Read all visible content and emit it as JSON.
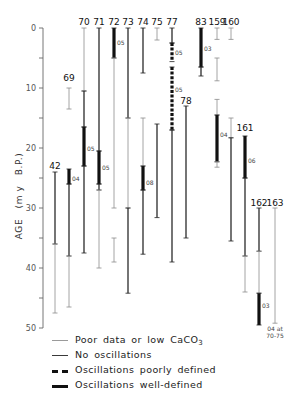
{
  "chart_data": {
    "type": "bar",
    "subtype": "floating-range-bars",
    "title": "",
    "xlabel": "",
    "ylabel": "AGE   (m y   B.P.)",
    "ylim": [
      0,
      50
    ],
    "y_inverted": true,
    "yticks": [
      0,
      10,
      20,
      30,
      40,
      50
    ],
    "yminor_ticks": [
      5,
      15,
      25,
      35,
      45
    ],
    "grid": false,
    "styles": {
      "poor": {
        "label": "Poor data or low CaCO3",
        "color": "#9a9a9a",
        "width": 0.9,
        "dash": ""
      },
      "none": {
        "label": "No oscillations",
        "color": "#3a3a3a",
        "width": 1.4,
        "dash": ""
      },
      "poorly": {
        "label": "Oscillations poorly defined",
        "color": "#111111",
        "width": 3.2,
        "dash": "3,1.6"
      },
      "well": {
        "label": "Oscillations well-defined",
        "color": "#111111",
        "width": 3.2,
        "dash": ""
      }
    },
    "sites": [
      {
        "site": "42",
        "x": 55,
        "label_y": 169,
        "segments": [
          {
            "from": 24,
            "to": 36,
            "style": "none"
          },
          {
            "from": 36,
            "to": 47.5,
            "style": "poor"
          }
        ]
      },
      {
        "site": "69",
        "x": 69,
        "label_y": 81,
        "segments": [
          {
            "from": 10,
            "to": 13.5,
            "style": "poor"
          },
          {
            "from": 23.5,
            "to": 26,
            "style": "well",
            "period": "04",
            "period_at": 25
          },
          {
            "from": 26,
            "to": 38,
            "style": "none"
          },
          {
            "from": 38,
            "to": 46.5,
            "style": "poor"
          }
        ]
      },
      {
        "site": "70",
        "x": 84,
        "label_y": 25,
        "segments": [
          {
            "from": 0,
            "to": 10.5,
            "style": "poor"
          },
          {
            "from": 10.5,
            "to": 16.5,
            "style": "none"
          },
          {
            "from": 16.5,
            "to": 23,
            "style": "well",
            "period": "05",
            "period_at": 20
          },
          {
            "from": 23,
            "to": 37.5,
            "style": "none"
          }
        ]
      },
      {
        "site": "71",
        "x": 99,
        "label_y": 25,
        "segments": [
          {
            "from": 0,
            "to": 20.5,
            "style": "none"
          },
          {
            "from": 20.5,
            "to": 26,
            "style": "well",
            "period": "05",
            "period_at": 23.3
          },
          {
            "from": 26,
            "to": 27,
            "style": "none"
          },
          {
            "from": 27,
            "to": 40,
            "style": "poor"
          }
        ]
      },
      {
        "site": "72",
        "x": 114,
        "label_y": 25,
        "segments": [
          {
            "from": 0,
            "to": 5,
            "style": "well",
            "period": "05",
            "period_at": 2.4
          },
          {
            "from": 5,
            "to": 30,
            "style": "poor"
          },
          {
            "from": 35,
            "to": 39,
            "style": "poor"
          }
        ]
      },
      {
        "site": "73",
        "x": 128,
        "label_y": 25,
        "segments": [
          {
            "from": 0,
            "to": 15,
            "style": "none"
          },
          {
            "from": 15,
            "to": 30,
            "style": "poor"
          },
          {
            "from": 30,
            "to": 44.2,
            "style": "none"
          }
        ]
      },
      {
        "site": "74",
        "x": 143,
        "label_y": 25,
        "segments": [
          {
            "from": 0,
            "to": 7.5,
            "style": "none"
          },
          {
            "from": 15,
            "to": 23,
            "style": "poor"
          },
          {
            "from": 23,
            "to": 27,
            "style": "well",
            "period": "08",
            "period_at": 25.7
          },
          {
            "from": 27,
            "to": 37.7,
            "style": "none"
          }
        ]
      },
      {
        "site": "75",
        "x": 157,
        "label_y": 25,
        "segments": [
          {
            "from": 0,
            "to": 2,
            "style": "poor"
          },
          {
            "from": 16,
            "to": 31.6,
            "style": "none"
          }
        ]
      },
      {
        "site": "77",
        "x": 172,
        "label_y": 25,
        "segments": [
          {
            "from": 0,
            "to": 2.5,
            "style": "none"
          },
          {
            "from": 2.5,
            "to": 5.6,
            "style": "poorly",
            "period": "05",
            "period_at": 4.1
          },
          {
            "from": 6.5,
            "to": 17,
            "style": "poorly",
            "period": "05",
            "period_at": 10.2
          },
          {
            "from": 17,
            "to": 39,
            "style": "none"
          }
        ]
      },
      {
        "site": "78",
        "x": 186,
        "label_y": 104,
        "segments": [
          {
            "from": 13,
            "to": 35,
            "style": "none"
          }
        ]
      },
      {
        "site": "83",
        "x": 201,
        "label_y": 25,
        "segments": [
          {
            "from": 0,
            "to": 6.5,
            "style": "well",
            "period": "03",
            "period_at": 3.4
          },
          {
            "from": 6.5,
            "to": 8,
            "style": "none"
          }
        ]
      },
      {
        "site": "159",
        "x": 217,
        "label_y": 25,
        "segments": [
          {
            "from": 0,
            "to": 1.9,
            "style": "poor"
          },
          {
            "from": 5,
            "to": 8.8,
            "style": "poor"
          },
          {
            "from": 11.9,
            "to": 14.5,
            "style": "poor"
          },
          {
            "from": 14.5,
            "to": 22.3,
            "style": "well",
            "period": "04",
            "period_at": 17.8
          },
          {
            "from": 22.3,
            "to": 23.2,
            "style": "poor"
          }
        ]
      },
      {
        "site": "160",
        "x": 231,
        "label_y": 25,
        "segments": [
          {
            "from": 0,
            "to": 1.9,
            "style": "poor"
          },
          {
            "from": 15,
            "to": 18.3,
            "style": "poor"
          },
          {
            "from": 18.3,
            "to": 35.5,
            "style": "none"
          }
        ]
      },
      {
        "site": "161",
        "x": 245,
        "label_y": 131,
        "segments": [
          {
            "from": 18,
            "to": 25,
            "style": "well",
            "period": "06",
            "period_at": 22
          },
          {
            "from": 25,
            "to": 38,
            "style": "none"
          },
          {
            "from": 38,
            "to": 44,
            "style": "poor"
          }
        ]
      },
      {
        "site": "162",
        "x": 259,
        "label_y": 206,
        "segments": [
          {
            "from": 30,
            "to": 37.2,
            "style": "none"
          },
          {
            "from": 37.2,
            "to": 44.2,
            "style": "poor"
          },
          {
            "from": 44.2,
            "to": 49.5,
            "style": "well",
            "period": "03",
            "period_at": 46.2
          }
        ]
      },
      {
        "site": "163",
        "x": 275,
        "label_y": 206,
        "segments": [
          {
            "from": 30,
            "to": 49.2,
            "style": "poor"
          }
        ],
        "annotation": [
          "04 at",
          "70-75"
        ]
      }
    ]
  },
  "legend": {
    "items": [
      {
        "style": "poor",
        "label": "Poor data or low CaCO",
        "sub": "3"
      },
      {
        "style": "none",
        "label": "No oscillations",
        "sub": ""
      },
      {
        "style": "poorly",
        "label": "Oscillations poorly defined",
        "sub": ""
      },
      {
        "style": "well",
        "label": "Oscillations well-defined",
        "sub": ""
      }
    ]
  }
}
